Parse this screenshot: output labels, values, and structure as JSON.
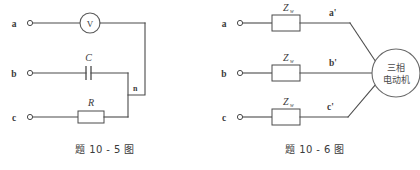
{
  "figures": [
    {
      "id": "fig-10-5",
      "caption": "题 10 - 5 图",
      "terminals": [
        {
          "label": "a",
          "y": 23
        },
        {
          "label": "b",
          "y": 73
        },
        {
          "label": "c",
          "y": 117
        }
      ],
      "node_label": "n",
      "components": [
        {
          "name": "voltmeter",
          "label": "V",
          "branch": "a"
        },
        {
          "name": "capacitor",
          "label": "C",
          "branch": "b"
        },
        {
          "name": "resistor",
          "label": "R",
          "branch": "c"
        }
      ]
    },
    {
      "id": "fig-10-6",
      "caption": "题 10 - 6 图",
      "terminals": [
        {
          "label": "a",
          "prime": "a'",
          "y": 23
        },
        {
          "label": "b",
          "prime": "b'",
          "y": 73
        },
        {
          "label": "c",
          "prime": "c'",
          "y": 117
        }
      ],
      "impedance_label": "Z",
      "impedance_subscript": "w",
      "motor_line1": "三相",
      "motor_line2": "电动机"
    }
  ],
  "colors": {
    "wire": "#4a4a4a",
    "text": "#3a3a3a",
    "background": "#ffffff"
  }
}
